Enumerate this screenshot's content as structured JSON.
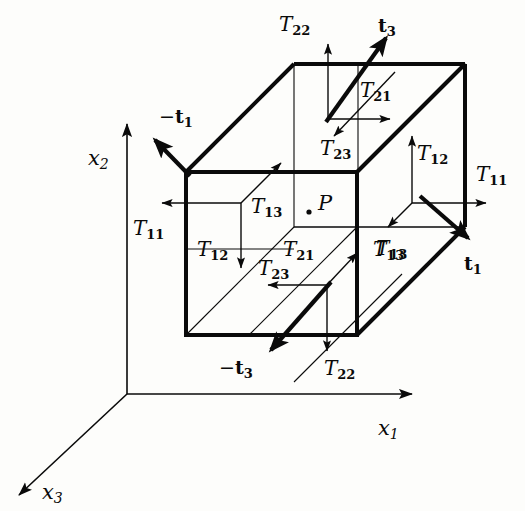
{
  "figure": {
    "background_color": "#fdfdfb",
    "ink_color": "#0a0a0a"
  },
  "axes": {
    "origin": {
      "x": 127,
      "y": 394
    },
    "items": [
      {
        "name": "x2",
        "base": "x",
        "sub": "2",
        "label_x": 88,
        "label_y": 148,
        "direction": "up",
        "tip": {
          "x": 127,
          "y": 120
        }
      },
      {
        "name": "x1",
        "base": "x",
        "sub": "1",
        "label_x": 378,
        "label_y": 418,
        "direction": "right",
        "tip": {
          "x": 416,
          "y": 394
        }
      },
      {
        "name": "x3",
        "base": "x",
        "sub": "3",
        "label_x": 42,
        "label_y": 488,
        "direction": "down-left",
        "tip": {
          "x": 14,
          "y": 499
        }
      }
    ]
  },
  "cube": {
    "description": "Oblique-projection rectangular element",
    "front_face": {
      "left": 186,
      "top": 172,
      "right": 357,
      "bottom": 335
    },
    "depth_offset": {
      "dx": 108,
      "dy": -108
    },
    "stroke_heavy": 4,
    "stroke_light": 1.1
  },
  "point": {
    "name": "P",
    "base": "P",
    "label_x": 318,
    "label_y": 196,
    "dot_x": 309,
    "dot_y": 212
  },
  "traction_vectors": [
    {
      "id": "t3-positive",
      "base": "t",
      "sub": "3",
      "minus": false,
      "label_x": 378,
      "label_y": 22,
      "from": {
        "x": 328,
        "y": 119
      },
      "to": {
        "x": 390,
        "y": 32
      },
      "face": "top"
    },
    {
      "id": "t1-negative",
      "base": "t",
      "sub": "1",
      "minus": true,
      "label_x": 163,
      "label_y": 112,
      "from": {
        "x": 188,
        "y": 174
      },
      "to": {
        "x": 151,
        "y": 136
      },
      "face": "left"
    },
    {
      "id": "t1-positive",
      "base": "t",
      "sub": "1",
      "minus": false,
      "label_x": 464,
      "label_y": 258,
      "from": {
        "x": 420,
        "y": 196
      },
      "to": {
        "x": 472,
        "y": 242
      },
      "face": "right"
    },
    {
      "id": "t3-negative",
      "base": "t",
      "sub": "3",
      "minus": true,
      "label_x": 222,
      "label_y": 362,
      "from": {
        "x": 330,
        "y": 283
      },
      "to": {
        "x": 266,
        "y": 355
      },
      "face": "bottom"
    }
  ],
  "stress_labels": [
    {
      "id": "T22-top",
      "base": "T",
      "sub": "22",
      "label_x": 282,
      "label_y": 18,
      "face": "top-face",
      "arrow_from": {
        "x": 328,
        "y": 119
      },
      "arrow_to": {
        "x": 328,
        "y": 38
      }
    },
    {
      "id": "T21-top",
      "base": "T",
      "sub": "21",
      "label_x": 362,
      "label_y": 85,
      "face": "top-face",
      "arrow_from": {
        "x": 328,
        "y": 119
      },
      "arrow_to": {
        "x": 396,
        "y": 119
      }
    },
    {
      "id": "T23-top",
      "base": "T",
      "sub": "23",
      "label_x": 322,
      "label_y": 142,
      "face": "top-face",
      "arrow_from": {
        "x": 396,
        "y": 72
      },
      "arrow_to": {
        "x": 330,
        "y": 141
      }
    },
    {
      "id": "T11-right",
      "base": "T",
      "sub": "11",
      "label_x": 478,
      "label_y": 168,
      "face": "right-face",
      "arrow_from": {
        "x": 412,
        "y": 203
      },
      "arrow_to": {
        "x": 492,
        "y": 203
      }
    },
    {
      "id": "T12-right",
      "base": "T",
      "sub": "12",
      "label_x": 418,
      "label_y": 148,
      "face": "right-face",
      "arrow_from": {
        "x": 412,
        "y": 203
      },
      "arrow_to": {
        "x": 412,
        "y": 130
      }
    },
    {
      "id": "T13-right",
      "base": "T",
      "sub": "13",
      "label_x": 378,
      "label_y": 243,
      "face": "right-face",
      "arrow_from": {
        "x": 412,
        "y": 203
      },
      "arrow_to": {
        "x": 383,
        "y": 232
      }
    },
    {
      "id": "T11-left",
      "base": "T",
      "sub": "11",
      "label_x": 135,
      "label_y": 222,
      "face": "left-face",
      "arrow_from": {
        "x": 241,
        "y": 203
      },
      "arrow_to": {
        "x": 156,
        "y": 203
      }
    },
    {
      "id": "T12-left",
      "base": "T",
      "sub": "12",
      "label_x": 200,
      "label_y": 243,
      "face": "left-face",
      "arrow_from": {
        "x": 241,
        "y": 203
      },
      "arrow_to": {
        "x": 241,
        "y": 273
      }
    },
    {
      "id": "T13-left",
      "base": "T",
      "sub": "13",
      "label_x": 253,
      "label_y": 200,
      "face": "left-face",
      "arrow_from": {
        "x": 241,
        "y": 203
      },
      "arrow_to": {
        "x": 277,
        "y": 163
      }
    },
    {
      "id": "T21-bottom",
      "base": "T",
      "sub": "21",
      "label_x": 285,
      "label_y": 243,
      "face": "bottom-face",
      "arrow_from": {
        "x": 327,
        "y": 285
      },
      "arrow_to": {
        "x": 263,
        "y": 285
      }
    },
    {
      "id": "T23-bottom",
      "base": "T",
      "sub": "23",
      "label_x": 261,
      "label_y": 262,
      "face": "bottom-face",
      "arrow_from": {
        "x": 263,
        "y": 285
      },
      "arrow_to": {
        "x": 263,
        "y": 285
      }
    },
    {
      "id": "T22-bottom",
      "base": "T",
      "sub": "22",
      "label_x": 326,
      "label_y": 362,
      "face": "bottom-face",
      "arrow_from": {
        "x": 327,
        "y": 285
      },
      "arrow_to": {
        "x": 327,
        "y": 356
      }
    },
    {
      "id": "T13-bottom",
      "base": "T",
      "sub": "13",
      "label_x": 375,
      "label_y": 243,
      "face": "bottom-face",
      "arrow_from": {
        "x": 327,
        "y": 285
      },
      "arrow_to": {
        "x": 360,
        "y": 250
      }
    }
  ]
}
